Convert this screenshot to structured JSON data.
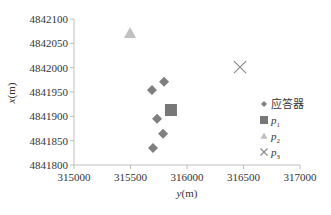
{
  "chart_data": {
    "type": "scatter",
    "title": "",
    "xlabel": "y(m)",
    "ylabel": "x(m)",
    "xlim": [
      315000,
      317000
    ],
    "ylim": [
      4841800,
      4842100
    ],
    "x_ticks": [
      315000,
      315500,
      316000,
      316500,
      317000
    ],
    "y_ticks": [
      4841800,
      4841850,
      4841900,
      4841950,
      4842000,
      4842050,
      4842100
    ],
    "grid": false,
    "legend_position": "right",
    "series": [
      {
        "name": "应答器",
        "marker": "diamond",
        "color": "#7f7f7f",
        "points": [
          {
            "y": 315690,
            "x": 4841954
          },
          {
            "y": 315797,
            "x": 4841971
          },
          {
            "y": 315735,
            "x": 4841895
          },
          {
            "y": 315788,
            "x": 4841864
          },
          {
            "y": 315699,
            "x": 4841835
          }
        ]
      },
      {
        "name": "p1",
        "marker": "square",
        "color": "#777777",
        "points": [
          {
            "y": 315858,
            "x": 4841913
          }
        ]
      },
      {
        "name": "p2",
        "marker": "triangle",
        "color": "#c0c0c0",
        "points": [
          {
            "y": 315496,
            "x": 4842071
          }
        ]
      },
      {
        "name": "p3",
        "marker": "cross",
        "color": "#8c8c8c",
        "points": [
          {
            "y": 316469,
            "x": 4842001
          }
        ]
      }
    ]
  },
  "legend": {
    "items": [
      {
        "label": "应答器",
        "sub": ""
      },
      {
        "label": "p",
        "sub": "1"
      },
      {
        "label": "p",
        "sub": "2"
      },
      {
        "label": "p",
        "sub": "3"
      }
    ]
  },
  "axes": {
    "x_title_var": "y",
    "x_title_unit": "(m)",
    "y_title_var": "x",
    "y_title_unit": "(m)",
    "axis_color": "#bfbfbf"
  }
}
